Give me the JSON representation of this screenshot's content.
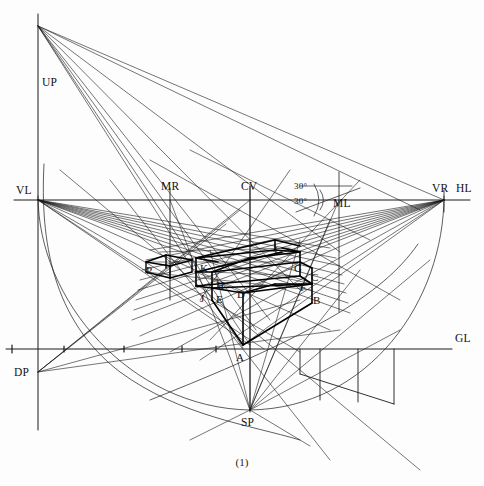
{
  "figure": {
    "caption": "(1)",
    "background_color": "#fdfdfd",
    "line_color": "#1a1a1a",
    "width": 484,
    "height": 486
  },
  "reference_labels": [
    {
      "id": "UP",
      "text": "UP",
      "x": 42,
      "y": 76,
      "role": "vertical-measuring-point"
    },
    {
      "id": "VL",
      "text": "VL",
      "x": 16,
      "y": 184,
      "role": "left-vanishing-point"
    },
    {
      "id": "MR",
      "text": "MR",
      "x": 161,
      "y": 180,
      "role": "right-measuring-point"
    },
    {
      "id": "CV",
      "text": "CV",
      "x": 241,
      "y": 180,
      "role": "center-of-vision"
    },
    {
      "id": "ML",
      "text": "ML",
      "x": 333,
      "y": 197,
      "role": "left-measuring-point"
    },
    {
      "id": "VR",
      "text": "VR",
      "x": 432,
      "y": 182,
      "role": "right-vanishing-point"
    },
    {
      "id": "HL",
      "text": "HL",
      "x": 456,
      "y": 182,
      "role": "horizon-line"
    },
    {
      "id": "GL",
      "text": "GL",
      "x": 455,
      "y": 332,
      "role": "ground-line"
    },
    {
      "id": "DP",
      "text": "DP",
      "x": 14,
      "y": 366,
      "role": "distance-point"
    },
    {
      "id": "SP",
      "text": "SP",
      "x": 241,
      "y": 416,
      "role": "station-point"
    }
  ],
  "angle_labels": [
    {
      "text": "30°",
      "x": 294,
      "y": 181
    },
    {
      "text": "30°",
      "x": 294,
      "y": 196
    }
  ],
  "vertex_labels": [
    {
      "text": "A",
      "x": 236,
      "y": 351
    },
    {
      "text": "B",
      "x": 313,
      "y": 294
    },
    {
      "text": "C",
      "x": 311,
      "y": 271
    },
    {
      "text": "D",
      "x": 237,
      "y": 288
    },
    {
      "text": "E",
      "x": 216,
      "y": 293
    },
    {
      "text": "F",
      "x": 300,
      "y": 281
    },
    {
      "text": "G",
      "x": 294,
      "y": 262
    },
    {
      "text": "H",
      "x": 216,
      "y": 279
    },
    {
      "text": "J",
      "x": 200,
      "y": 292
    },
    {
      "text": "K",
      "x": 200,
      "y": 262
    },
    {
      "text": "L",
      "x": 274,
      "y": 244
    },
    {
      "text": "P",
      "x": 146,
      "y": 264
    }
  ],
  "key_points": {
    "UP": {
      "x": 38,
      "y": 26
    },
    "VL": {
      "x": 38,
      "y": 200
    },
    "MR": {
      "x": 170,
      "y": 200
    },
    "CV": {
      "x": 250,
      "y": 200
    },
    "ML": {
      "x": 339,
      "y": 200
    },
    "VR": {
      "x": 444,
      "y": 200
    },
    "DP": {
      "x": 38,
      "y": 372
    },
    "SP": {
      "x": 250,
      "y": 410
    },
    "A": {
      "x": 243,
      "y": 345
    },
    "GL_y": 349,
    "HL_y": 200
  },
  "geometry_notes": {
    "horizon_line": "horizontal through VL, MR, CV, ML, VR at y=200",
    "ground_line": "horizontal at y=349 passing DP level region and right edge",
    "vertical_axes": [
      "x=38 (UP-VL-DP)",
      "x=170 (MR)",
      "x=250 (CV-SP-A)"
    ],
    "arcs": [
      "large arc VL to VR through SP region",
      "secondary arc near DP"
    ],
    "grid_below_gl": [
      320,
      358,
      394
    ]
  }
}
